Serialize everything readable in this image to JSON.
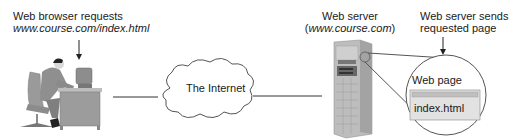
{
  "browser": {
    "label_line1": "Web browser requests",
    "label_line2": "www.course.com/index.html"
  },
  "internet": {
    "label": "The Internet"
  },
  "server": {
    "label_line1": "Web server",
    "label_line2_prefix": "(",
    "label_line2_domain": "www.course.com",
    "label_line2_suffix": ")"
  },
  "response": {
    "label_line1": "Web server sends",
    "label_line2": "requested page"
  },
  "webpage": {
    "title": "Web page",
    "filename": "index.html"
  },
  "colors": {
    "line": "#333333",
    "figure_gray": "#8a8a8a",
    "dark_gray": "#555555",
    "light_gray": "#cfcfcf",
    "page_box": "#e2e2e2"
  }
}
